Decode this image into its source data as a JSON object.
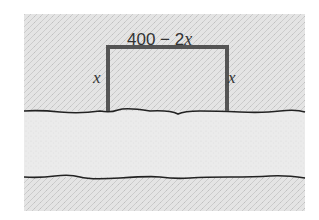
{
  "diagram": {
    "type": "fence-along-river",
    "labels": {
      "top_number": "400 − 2",
      "top_variable": "x",
      "left_side": "x",
      "right_side": "x"
    },
    "colors": {
      "field_texture": "#dcdcdc",
      "river_band": "#e8e8e8",
      "fence": "#555555",
      "riverbank_line": "#222222",
      "text": "#333333"
    }
  }
}
